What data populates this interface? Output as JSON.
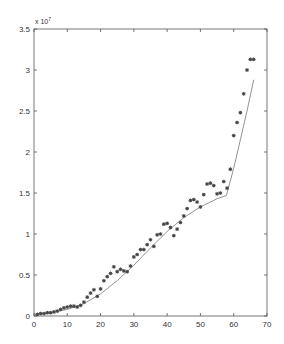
{
  "chart_data": {
    "type": "scatter",
    "title": "",
    "xlabel": "",
    "ylabel": "",
    "y_multiplier_label": "x 10",
    "y_multiplier_exponent": "7",
    "xlim": [
      0,
      70
    ],
    "ylim": [
      0,
      3.5
    ],
    "xticks": [
      0,
      10,
      20,
      30,
      40,
      50,
      60,
      70
    ],
    "yticks": [
      0,
      0.5,
      1,
      1.5,
      2,
      2.5,
      3,
      3.5
    ],
    "xtick_labels": [
      "0",
      "10",
      "20",
      "30",
      "40",
      "50",
      "60",
      "70"
    ],
    "ytick_labels": [
      "0",
      "0.5",
      "1",
      "1.5",
      "2",
      "2.5",
      "3",
      "3.5"
    ],
    "grid": false,
    "legend": null,
    "series": [
      {
        "name": "observed",
        "style": "markers",
        "marker": "*",
        "x": [
          1,
          2,
          3,
          4,
          5,
          6,
          7,
          8,
          9,
          10,
          11,
          12,
          13,
          14,
          15,
          16,
          17,
          18,
          19,
          20,
          21,
          22,
          23,
          24,
          25,
          26,
          27,
          28,
          29,
          30,
          31,
          32,
          33,
          34,
          35,
          36,
          37,
          38,
          39,
          40,
          41,
          42,
          43,
          44,
          45,
          46,
          47,
          48,
          49,
          50,
          51,
          52,
          53,
          54,
          55,
          56,
          57,
          58,
          59,
          60,
          61,
          62,
          63,
          64,
          65,
          66
        ],
        "y": [
          0.02,
          0.03,
          0.03,
          0.04,
          0.04,
          0.05,
          0.06,
          0.08,
          0.1,
          0.11,
          0.12,
          0.12,
          0.11,
          0.13,
          0.17,
          0.23,
          0.28,
          0.32,
          0.24,
          0.33,
          0.43,
          0.48,
          0.52,
          0.6,
          0.54,
          0.57,
          0.55,
          0.54,
          0.61,
          0.72,
          0.75,
          0.81,
          0.81,
          0.87,
          0.93,
          0.85,
          0.99,
          1.0,
          1.12,
          1.13,
          1.08,
          0.98,
          1.06,
          1.14,
          1.22,
          1.31,
          1.41,
          1.42,
          1.39,
          1.33,
          1.48,
          1.61,
          1.62,
          1.59,
          1.49,
          1.5,
          1.64,
          1.56,
          1.79,
          2.2,
          2.36,
          2.48,
          2.71,
          3.0,
          3.13,
          3.13
        ]
      },
      {
        "name": "fit",
        "style": "line",
        "x": [
          0,
          5,
          10,
          15,
          20,
          25,
          30,
          35,
          40,
          45,
          50,
          55,
          57.8,
          60,
          62,
          64,
          66
        ],
        "y": [
          0.02,
          0.04,
          0.08,
          0.15,
          0.27,
          0.43,
          0.62,
          0.83,
          1.03,
          1.2,
          1.33,
          1.43,
          1.47,
          1.8,
          2.15,
          2.5,
          2.88
        ]
      }
    ],
    "units_note": "y values in units of 1e7"
  }
}
